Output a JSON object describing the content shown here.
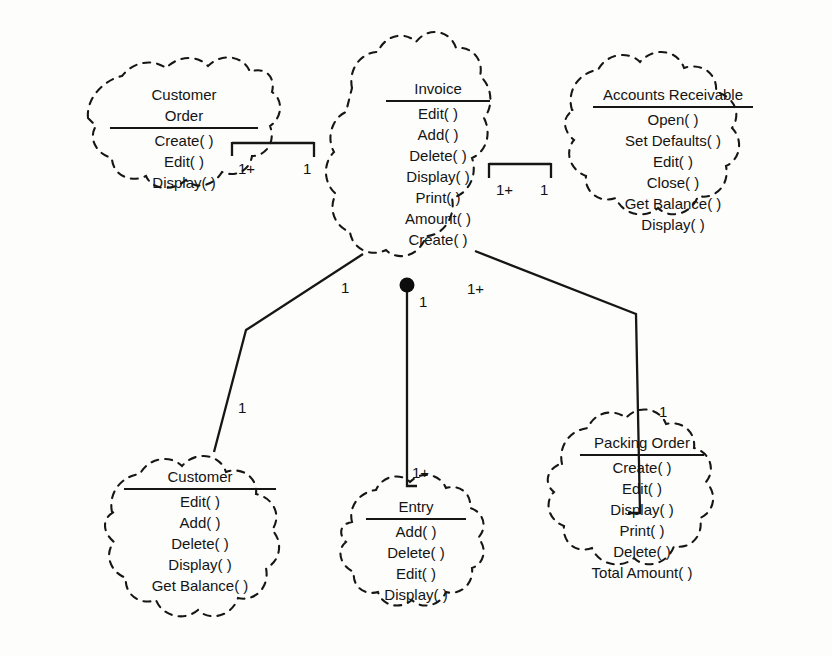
{
  "diagram": {
    "type": "uml-class-diagram",
    "background_color": "#fdfdfb",
    "line_color": "#161616",
    "text_color": "#141414",
    "cloud_style": "dashed-irregular-outline"
  },
  "nodes": [
    {
      "id": "customer-order",
      "title": "Customer\nOrder",
      "title_lines": [
        "Customer",
        "Order"
      ],
      "methods": [
        "Create( )",
        "Edit( )",
        "Display( )"
      ],
      "rule_width": 148
    },
    {
      "id": "invoice",
      "title": "Invoice",
      "title_lines": [
        "Invoice"
      ],
      "methods": [
        "Edit( )",
        "Add( )",
        "Delete( )",
        "Display( )",
        "Print( )",
        "Amount( )",
        "Create( )"
      ],
      "rule_width": 104
    },
    {
      "id": "accounts-receivable",
      "title": "Accounts Receivable",
      "title_lines": [
        "Accounts Receivable"
      ],
      "methods": [
        "Open( )",
        "Set Defaults( )",
        "Edit( )",
        "Close( )",
        "Get Balance( )",
        "Display( )"
      ],
      "rule_width": 160
    },
    {
      "id": "customer",
      "title": "Customer",
      "title_lines": [
        "Customer"
      ],
      "methods": [
        "Edit( )",
        "Add( )",
        "Delete( )",
        "Display( )",
        "Get Balance( )"
      ],
      "rule_width": 152
    },
    {
      "id": "entry",
      "title": "Entry",
      "title_lines": [
        "Entry"
      ],
      "methods": [
        "Add( )",
        "Delete( )",
        "Edit( )",
        "Display( )"
      ],
      "rule_width": 100
    },
    {
      "id": "packing-order",
      "title": "Packing Order",
      "title_lines": [
        "Packing Order"
      ],
      "methods": [
        "Create( )",
        "Edit( )",
        "Display( )",
        "Print( )",
        "Delete( )",
        "Total Amount( )"
      ],
      "rule_width": 124
    }
  ],
  "connections": [
    {
      "id": "customer-order-to-invoice",
      "from": "customer-order",
      "to": "invoice",
      "style": "bracket",
      "from_multiplicity": "1+",
      "to_multiplicity": "1"
    },
    {
      "id": "invoice-to-accounts-receivable",
      "from": "invoice",
      "to": "accounts-receivable",
      "style": "bracket",
      "from_multiplicity": "1+",
      "to_multiplicity": "1"
    },
    {
      "id": "invoice-to-customer",
      "from": "invoice",
      "to": "customer",
      "style": "polyline",
      "from_multiplicity": "1",
      "to_multiplicity": "1"
    },
    {
      "id": "invoice-to-entry",
      "from": "invoice",
      "to": "entry",
      "style": "composition",
      "from_multiplicity": "1",
      "to_multiplicity": "1+"
    },
    {
      "id": "invoice-to-packing-order",
      "from": "invoice",
      "to": "packing-order",
      "style": "polyline",
      "from_multiplicity": "1+",
      "to_multiplicity": "1"
    }
  ],
  "multiplicity_labels": [
    {
      "id": "m-co-inv-left",
      "text": "1+",
      "x": 238,
      "y": 161
    },
    {
      "id": "m-co-inv-right",
      "text": "1",
      "x": 303,
      "y": 161
    },
    {
      "id": "m-inv-ar-left",
      "text": "1+",
      "x": 496,
      "y": 182
    },
    {
      "id": "m-inv-ar-right",
      "text": "1",
      "x": 540,
      "y": 182
    },
    {
      "id": "m-inv-cust-top",
      "text": "1",
      "x": 341,
      "y": 280
    },
    {
      "id": "m-inv-cust-bot",
      "text": "1",
      "x": 238,
      "y": 400
    },
    {
      "id": "m-inv-entry-top",
      "text": "1",
      "x": 419,
      "y": 294
    },
    {
      "id": "m-inv-entry-bot",
      "text": "1+",
      "x": 412,
      "y": 465
    },
    {
      "id": "m-inv-pack-top",
      "text": "1+",
      "x": 467,
      "y": 281
    },
    {
      "id": "m-inv-pack-bot",
      "text": "1",
      "x": 659,
      "y": 404
    }
  ]
}
